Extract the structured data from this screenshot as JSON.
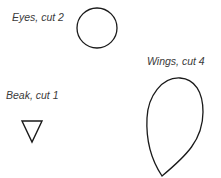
{
  "labels": {
    "eyes": "Eyes, cut 2",
    "wings": "Wings, cut 4",
    "beak": "Beak, cut 1"
  },
  "shapes": [
    {
      "name": "eye",
      "type": "circle",
      "cut": 2
    },
    {
      "name": "wing",
      "type": "teardrop",
      "cut": 4
    },
    {
      "name": "beak",
      "type": "triangle",
      "cut": 1
    }
  ],
  "colors": {
    "stroke": "#1a1a1a",
    "text": "#3a3a3a",
    "background": "#ffffff"
  }
}
